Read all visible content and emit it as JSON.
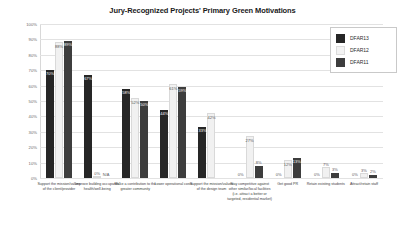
{
  "chart_data": {
    "type": "bar",
    "title": "Jury-Recognized Projects' Primary Green Motivations",
    "xlabel": "",
    "ylabel": "",
    "ylim": [
      0,
      100
    ],
    "grid": true,
    "legend_position": "top-right",
    "ytick_labels": [
      "100%",
      "90%",
      "80%",
      "70%",
      "60%",
      "50%",
      "40%",
      "30%",
      "20%",
      "10%",
      "0%"
    ],
    "ytick_values": [
      100,
      90,
      80,
      70,
      60,
      50,
      40,
      30,
      20,
      10,
      0
    ],
    "categories": [
      "Support the mission/values of the client/provider",
      "Improve building occupants' health/well-being",
      "Make a contribution to the greater community",
      "Lower operational costs",
      "Support the mission/values of the design team",
      "Stay competitive against other similar/local facilities (i.e. attract a better or targeted, residential market)",
      "Get good PR",
      "Retain existing students",
      "Attract/retain staff"
    ],
    "series": [
      {
        "name": "DFAR13",
        "color": "#262626",
        "values": [
          70,
          67,
          58,
          44,
          33,
          0,
          0,
          0,
          0
        ],
        "labels": [
          "70%",
          "67%",
          "58%",
          "44%",
          "33%",
          "0%",
          "0%",
          "0%",
          "0%"
        ]
      },
      {
        "name": "DFAR12",
        "color": "#f1f1f1",
        "values": [
          88,
          0,
          52,
          61,
          42,
          27,
          12,
          7,
          3
        ],
        "labels": [
          "88%",
          "0%",
          "52%",
          "61%",
          "42%",
          "27%",
          "12%",
          "7%",
          "3%"
        ]
      },
      {
        "name": "DFAR11",
        "color": "#3d3d3d",
        "values": [
          89,
          0,
          50,
          59,
          0,
          8,
          13,
          3,
          2
        ],
        "labels": [
          "89%",
          "N/A",
          "50%",
          "59%",
          "",
          "8%",
          "13%",
          "3%",
          "2%"
        ]
      }
    ]
  },
  "legend": {
    "entries": [
      {
        "label": "DFAR13"
      },
      {
        "label": "DFAR12"
      },
      {
        "label": "DFAR11"
      }
    ]
  }
}
